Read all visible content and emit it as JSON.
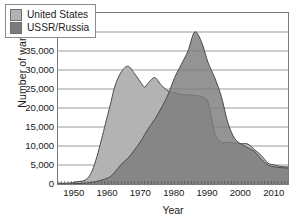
{
  "chart_data": {
    "type": "area",
    "title": "",
    "xlabel": "Year",
    "ylabel": "Number of warheads",
    "xlim": [
      1945,
      2014
    ],
    "ylim": [
      0,
      45000
    ],
    "grid": true,
    "legend_position": "top-left",
    "ytick_labels": [
      "45,000",
      "40,000",
      "35,000",
      "30,000",
      "25,000",
      "20,000",
      "15,000",
      "10,000",
      "5,000",
      "0"
    ],
    "ytick_values": [
      45000,
      40000,
      35000,
      30000,
      25000,
      20000,
      15000,
      10000,
      5000,
      0
    ],
    "xtick_labels": [
      "1950",
      "1960",
      "1970",
      "1980",
      "1990",
      "2000",
      "2010"
    ],
    "xtick_values": [
      1950,
      1960,
      1970,
      1980,
      1990,
      2000,
      2010
    ],
    "x": [
      1945,
      1950,
      1955,
      1960,
      1962,
      1964,
      1966,
      1968,
      1970,
      1971,
      1972,
      1974,
      1976,
      1978,
      1980,
      1982,
      1984,
      1986,
      1988,
      1990,
      1992,
      1994,
      1996,
      1998,
      2000,
      2002,
      2004,
      2006,
      2008,
      2010,
      2012,
      2014
    ],
    "series": [
      {
        "name": "United States",
        "color": "#b3b3b3",
        "values": [
          200,
          500,
          3000,
          18500,
          25500,
          29500,
          31000,
          29000,
          26500,
          25500,
          26500,
          28000,
          26000,
          24500,
          24000,
          23500,
          23500,
          23300,
          23000,
          21500,
          13500,
          11000,
          11000,
          10800,
          10600,
          10500,
          9000,
          7500,
          5500,
          5000,
          4600,
          4500
        ]
      },
      {
        "name": "USSR/Russia",
        "color": "#7c7c7c",
        "values": [
          0,
          100,
          400,
          1600,
          3100,
          5200,
          6800,
          9000,
          11500,
          13000,
          14500,
          17000,
          20000,
          23500,
          28000,
          31500,
          35000,
          40000,
          37500,
          32000,
          28000,
          23000,
          16000,
          12000,
          10500,
          9500,
          8500,
          6500,
          5000,
          4500,
          4300,
          4200
        ]
      }
    ],
    "annotations": {
      "us_peak": {
        "year": 1966,
        "value": 31000
      },
      "ussr_peak": {
        "year": 1986,
        "value": 40000
      }
    }
  },
  "legend": {
    "items": [
      {
        "label": "United States",
        "color": "#b3b3b3"
      },
      {
        "label": "USSR/Russia",
        "color": "#7c7c7c"
      }
    ]
  },
  "axes": {
    "y_title": "Number of warheads",
    "x_title": "Year"
  }
}
